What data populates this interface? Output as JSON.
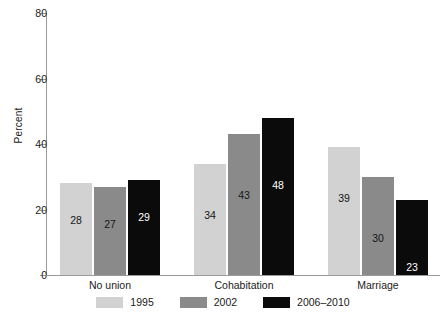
{
  "chart_data": {
    "type": "bar",
    "title": "",
    "xlabel": "",
    "ylabel": "Percent",
    "ylim": [
      0,
      80
    ],
    "yticks": [
      0,
      20,
      40,
      60,
      80
    ],
    "grid": false,
    "legend_position": "bottom-center",
    "categories": [
      "No union",
      "Cohabitation",
      "Marriage"
    ],
    "series": [
      {
        "name": "1995",
        "color": "#d2d2d2",
        "values": [
          28,
          34,
          39
        ]
      },
      {
        "name": "2002",
        "color": "#8a8a8a",
        "values": [
          27,
          43,
          30
        ]
      },
      {
        "name": "2006–2010",
        "color": "#0b0b0b",
        "values": [
          29,
          48,
          23
        ]
      }
    ],
    "bar_labels": [
      [
        "28",
        "27",
        "29"
      ],
      [
        "34",
        "43",
        "48"
      ],
      [
        "39",
        "30",
        "23"
      ]
    ]
  },
  "axis": {
    "y_title": "Percent",
    "y_tick_labels": [
      "80",
      "60",
      "40",
      "20",
      "0"
    ]
  },
  "legend": {
    "items": [
      {
        "label": "1995"
      },
      {
        "label": "2002"
      },
      {
        "label": "2006–2010"
      }
    ]
  }
}
